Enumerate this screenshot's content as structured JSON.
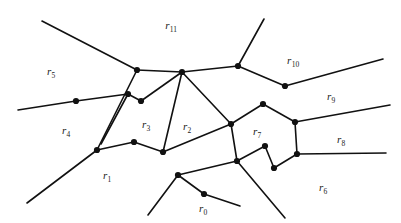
{
  "figure": {
    "type": "planar-graph-diagram",
    "width": 401,
    "height": 223,
    "background_color": "#ffffff",
    "stroke_color": "#111111",
    "vertex_color": "#111111",
    "edge_width": 1.6,
    "vertex_radius": 3.1
  },
  "region_labels": [
    {
      "id": "r0",
      "base": "r",
      "subscript": "0",
      "text": "r0",
      "x": 203,
      "y": 208
    },
    {
      "id": "r1",
      "base": "r",
      "subscript": "1",
      "text": "r1",
      "x": 107,
      "y": 175
    },
    {
      "id": "r2",
      "base": "r",
      "subscript": "2",
      "text": "r2",
      "x": 187,
      "y": 126
    },
    {
      "id": "r3",
      "base": "r",
      "subscript": "3",
      "text": "r3",
      "x": 146,
      "y": 124
    },
    {
      "id": "r4",
      "base": "r",
      "subscript": "4",
      "text": "r4",
      "x": 66,
      "y": 130
    },
    {
      "id": "r5",
      "base": "r",
      "subscript": "5",
      "text": "r5",
      "x": 51,
      "y": 71
    },
    {
      "id": "r6",
      "base": "r",
      "subscript": "6",
      "text": "r6",
      "x": 323,
      "y": 187
    },
    {
      "id": "r7",
      "base": "r",
      "subscript": "7",
      "text": "r7",
      "x": 257,
      "y": 131
    },
    {
      "id": "r8",
      "base": "r",
      "subscript": "8",
      "text": "r8",
      "x": 341,
      "y": 139
    },
    {
      "id": "r9",
      "base": "r",
      "subscript": "9",
      "text": "r9",
      "x": 331,
      "y": 96
    },
    {
      "id": "r10",
      "base": "r",
      "subscript": "10",
      "text": "r10",
      "x": 293,
      "y": 60
    },
    {
      "id": "r11",
      "base": "r",
      "subscript": "11",
      "text": "r11",
      "x": 171,
      "y": 25
    }
  ],
  "vertices": [
    {
      "id": "v-left-upper",
      "x": 137,
      "y": 70
    },
    {
      "id": "v-hub",
      "x": 182,
      "y": 72
    },
    {
      "id": "v-upper-right",
      "x": 238,
      "y": 66
    },
    {
      "id": "v-right-fork",
      "x": 285,
      "y": 86
    },
    {
      "id": "v-zig-a",
      "x": 128,
      "y": 94
    },
    {
      "id": "v-zig-b",
      "x": 141,
      "y": 101
    },
    {
      "id": "v-left-mid",
      "x": 76,
      "y": 101
    },
    {
      "id": "v-left-lower",
      "x": 97,
      "y": 150
    },
    {
      "id": "v-mid-peak",
      "x": 134,
      "y": 142
    },
    {
      "id": "v-mid-low",
      "x": 163,
      "y": 152
    },
    {
      "id": "v-r7-top",
      "x": 263,
      "y": 104
    },
    {
      "id": "v-r7-right-top",
      "x": 295,
      "y": 122
    },
    {
      "id": "v-r7-left",
      "x": 231,
      "y": 124
    },
    {
      "id": "v-r7-right-low",
      "x": 297,
      "y": 154
    },
    {
      "id": "v-r7-zig-top",
      "x": 265,
      "y": 146
    },
    {
      "id": "v-r7-zig-bot",
      "x": 274,
      "y": 168
    },
    {
      "id": "v-r7-bot-left",
      "x": 237,
      "y": 161
    },
    {
      "id": "v-bottom-peak",
      "x": 178,
      "y": 175
    },
    {
      "id": "v-bottom-low",
      "x": 204,
      "y": 194
    }
  ],
  "edges": [
    {
      "from": "v-left-upper",
      "to": "v-hub"
    },
    {
      "from": "v-hub",
      "to": "v-upper-right"
    },
    {
      "from": "v-upper-right",
      "to": "v-right-fork"
    },
    {
      "from": "v-hub",
      "to": "v-zig-b"
    },
    {
      "from": "v-zig-b",
      "to": "v-zig-a"
    },
    {
      "from": "v-hub",
      "to": "v-mid-low"
    },
    {
      "from": "v-hub",
      "to": "v-r7-left"
    },
    {
      "from": "v-left-upper",
      "to": "v-left-lower"
    },
    {
      "from": "v-left-mid",
      "to": "v-zig-a"
    },
    {
      "from": "v-left-lower",
      "to": "v-mid-peak"
    },
    {
      "from": "v-mid-peak",
      "to": "v-mid-low"
    },
    {
      "from": "v-mid-low",
      "to": "v-r7-left"
    },
    {
      "from": "v-r7-left",
      "to": "v-r7-top"
    },
    {
      "from": "v-r7-top",
      "to": "v-r7-right-top"
    },
    {
      "from": "v-r7-right-top",
      "to": "v-r7-right-low"
    },
    {
      "from": "v-r7-left",
      "to": "v-r7-bot-left"
    },
    {
      "from": "v-r7-bot-left",
      "to": "v-r7-zig-top"
    },
    {
      "from": "v-r7-zig-top",
      "to": "v-r7-zig-bot"
    },
    {
      "from": "v-r7-zig-bot",
      "to": "v-r7-right-low"
    },
    {
      "from": "v-r7-bot-left",
      "to": "v-bottom-peak"
    },
    {
      "from": "v-bottom-peak",
      "to": "v-bottom-low"
    }
  ],
  "open_edges": [
    {
      "name": "edge-to-left-top",
      "from": "v-left-upper",
      "to_x": 42,
      "to_y": 21
    },
    {
      "name": "edge-to-left-mid-out",
      "from": "v-left-mid",
      "to_x": 18,
      "to_y": 110
    },
    {
      "name": "edge-to-zig-a-out",
      "from": "v-zig-a",
      "to_x": 101,
      "to_y": 144
    },
    {
      "name": "edge-to-upper-out",
      "from": "v-upper-right",
      "to_x": 264,
      "to_y": 19
    },
    {
      "name": "edge-to-right-top-out",
      "from": "v-right-fork",
      "to_x": 383,
      "to_y": 59
    },
    {
      "name": "edge-to-right-mid-out",
      "from": "v-r7-right-top",
      "to_x": 390,
      "to_y": 105
    },
    {
      "name": "edge-to-right-flat-out",
      "from": "v-r7-right-low",
      "to_x": 386,
      "to_y": 153
    },
    {
      "name": "edge-to-lower-left-out",
      "from": "v-left-lower",
      "to_x": 27,
      "to_y": 203
    },
    {
      "name": "edge-to-bottom-out",
      "from": "v-r7-bot-left",
      "to_x": 285,
      "to_y": 218
    },
    {
      "name": "edge-to-bottom-left-out",
      "from": "v-bottom-peak",
      "to_x": 148,
      "to_y": 215
    },
    {
      "name": "edge-to-bottom-right-out",
      "from": "v-bottom-low",
      "to_x": 240,
      "to_y": 206
    }
  ]
}
